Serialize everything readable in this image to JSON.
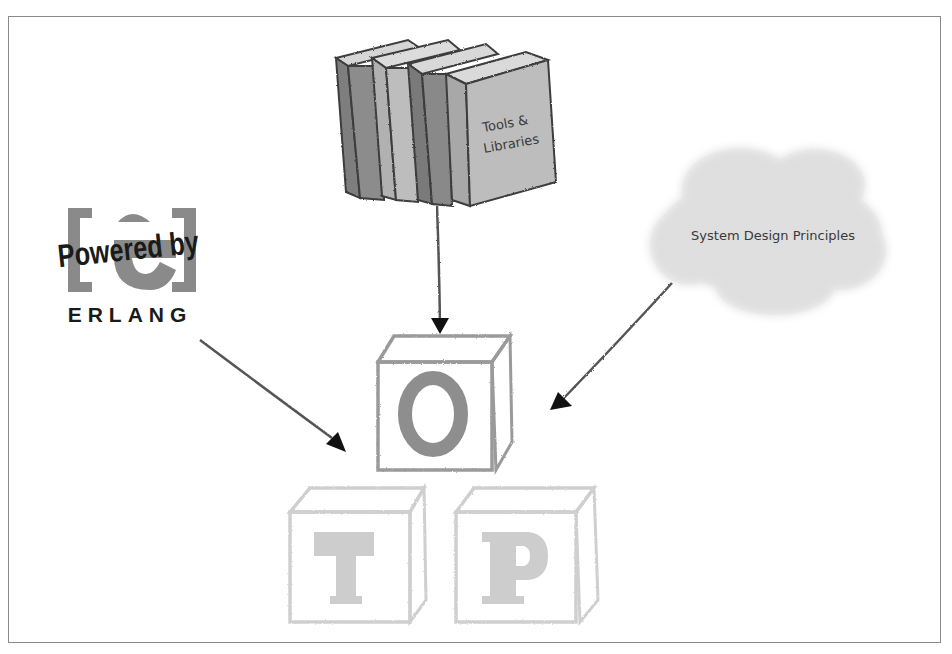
{
  "diagram": {
    "nodes": {
      "books": {
        "label_line1": "Tools &",
        "label_line2": "Libraries",
        "icon": "books-icon"
      },
      "erlang_logo": {
        "tagline": "Powered by",
        "name": "ERLANG",
        "icon": "erlang-logo"
      },
      "cloud": {
        "label": "System Design Principles",
        "icon": "cloud-icon"
      },
      "otp_blocks": {
        "blocks": [
          {
            "letter": "O",
            "emphasis": "dark"
          },
          {
            "letter": "T",
            "emphasis": "faded"
          },
          {
            "letter": "P",
            "emphasis": "faded"
          }
        ]
      }
    },
    "edges": [
      {
        "from": "books",
        "to": "otp_blocks"
      },
      {
        "from": "erlang_logo",
        "to": "otp_blocks"
      },
      {
        "from": "cloud",
        "to": "otp_blocks"
      }
    ],
    "colors": {
      "frame": "#8a8a8a",
      "book_dark": "#8c8c8c",
      "book_light": "#b9b9b9",
      "book_outline": "#3c3c3c",
      "cloud_fill": "#dcdcdc",
      "arrow_line": "#555555",
      "arrow_head": "#111111",
      "block_o": "#8e8e8e",
      "block_faded": "#cfcfcf",
      "logo_gray": "#8a8a8a",
      "logo_text": "#1a1a1a"
    }
  }
}
